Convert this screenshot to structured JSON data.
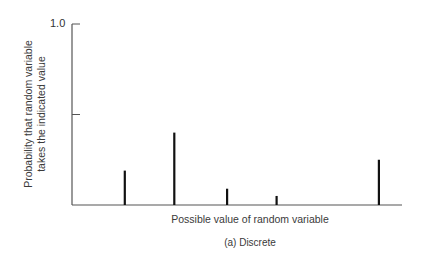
{
  "chart_data": {
    "type": "bar",
    "subtype": "stem / probability mass function",
    "title": "",
    "caption": "(a)  Discrete",
    "xlabel": "Possible value of random variable",
    "ylabel": "Probability that random variable takes the indicated value",
    "ylabel_lines": [
      "Probability that random variable",
      "takes the indicated value"
    ],
    "ylim": [
      0,
      1.0
    ],
    "yticks": [
      0.5,
      1.0
    ],
    "ytick_labels": [
      "",
      "1.0"
    ],
    "xticks": [],
    "grid": false,
    "legend": null,
    "categories": [
      "x1",
      "x2",
      "x3",
      "x4",
      "x5"
    ],
    "x_positions_relative": [
      0.16,
      0.31,
      0.47,
      0.62,
      0.93
    ],
    "values": [
      0.19,
      0.4,
      0.09,
      0.05,
      0.25
    ]
  },
  "layout": {
    "axis_color": "#555555",
    "bar_color": "#111111"
  }
}
